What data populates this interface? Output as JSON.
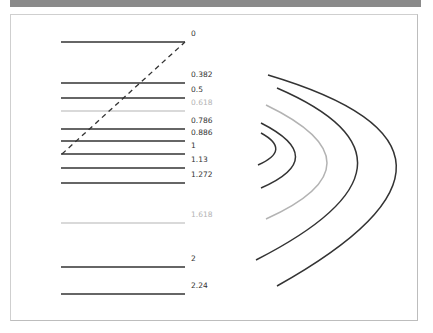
{
  "header": {
    "title": ""
  },
  "diagram": {
    "type": "fibonacci-retracement-and-arcs",
    "colors": {
      "dark": "#333333",
      "light": "#b3b3b3",
      "dashed": "#333333",
      "label_dark": "#333333",
      "label_light": "#b3b3b3"
    },
    "levels": [
      {
        "label": "0",
        "y": 42,
        "tone": "dark"
      },
      {
        "label": "0.382",
        "y": 83,
        "tone": "dark"
      },
      {
        "label": "0.5",
        "y": 98,
        "tone": "dark"
      },
      {
        "label": "0.618",
        "y": 111,
        "tone": "light"
      },
      {
        "label": "0.786",
        "y": 129,
        "tone": "dark"
      },
      {
        "label": "0.886",
        "y": 141,
        "tone": "dark"
      },
      {
        "label": "1",
        "y": 154,
        "tone": "dark"
      },
      {
        "label": "1.13",
        "y": 168,
        "tone": "dark"
      },
      {
        "label": "1.272",
        "y": 183,
        "tone": "dark"
      },
      {
        "label": "1.618",
        "y": 223,
        "tone": "light"
      },
      {
        "label": "2",
        "y": 267,
        "tone": "dark"
      },
      {
        "label": "2.24",
        "y": 294,
        "tone": "dark"
      }
    ],
    "trend_line": {
      "x1": 62,
      "y1": 154,
      "x2": 185,
      "y2": 42,
      "style": "dashed"
    },
    "arcs": [
      {
        "name": "arc-1",
        "d": "M261,133 Q292,150 258,165",
        "tone": "dark"
      },
      {
        "name": "arc-2",
        "d": "M261,123 Q330,158 261,188",
        "tone": "dark"
      },
      {
        "name": "arc-3",
        "d": "M266,105 Q388,164 266,219",
        "tone": "light"
      },
      {
        "name": "arc-4",
        "d": "M277,88 Q448,162 256,260",
        "tone": "dark"
      },
      {
        "name": "arc-5",
        "d": "M268,75 Q520,150 277,286",
        "tone": "dark"
      }
    ]
  }
}
